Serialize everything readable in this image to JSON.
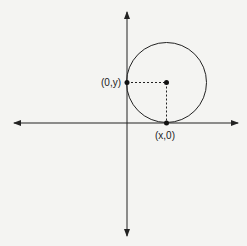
{
  "diagram": {
    "type": "coordinate-plane-with-circle",
    "labels": {
      "y_intercept_point": "(0,y)",
      "x_intercept_point": "(x,0)"
    },
    "colors": {
      "background": "#f4f4f2",
      "stroke": "#222222"
    },
    "elements": [
      "x-axis with arrows",
      "y-axis with arrows",
      "circle tangent to both axes",
      "center point",
      "tangent point on y-axis",
      "tangent point on x-axis",
      "dashed horizontal segment center to y-axis",
      "dashed vertical segment center to x-axis"
    ]
  }
}
